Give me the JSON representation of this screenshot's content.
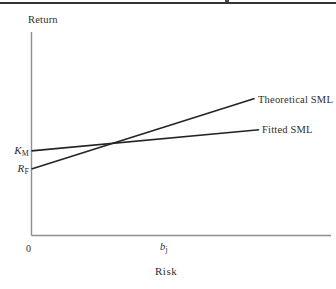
{
  "page": {
    "background": "#ffffff",
    "rule_color": "#343434"
  },
  "chart_data": {
    "type": "line",
    "title": "",
    "xlabel": "Risk",
    "ylabel": "Return",
    "grid": false,
    "legend": "inline-labels-at-line-ends",
    "axis_color": "#8e8e8e",
    "line_color": "#242424",
    "xlim": [
      0,
      1
    ],
    "ylim": [
      0,
      1
    ],
    "x_ticks": [
      {
        "label": "0",
        "x": 0
      },
      {
        "label": "b",
        "sub": "j",
        "x": 0.44
      }
    ],
    "y_ticks": [
      {
        "label": "K",
        "sub": "M",
        "y": 0.416
      },
      {
        "label": "R",
        "sub": "F",
        "y": 0.327
      }
    ],
    "series": [
      {
        "name": "Theoretical SML",
        "points": [
          [
            0,
            0.327
          ],
          [
            0.745,
            0.673
          ]
        ]
      },
      {
        "name": "Fitted SML",
        "points": [
          [
            0,
            0.416
          ],
          [
            0.76,
            0.52
          ]
        ]
      }
    ]
  }
}
